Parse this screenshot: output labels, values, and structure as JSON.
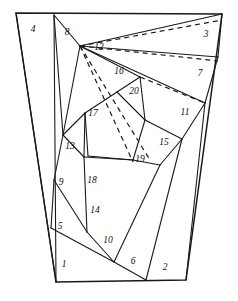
{
  "figure": {
    "type": "diagram",
    "canvas": {
      "width": 238,
      "height": 301
    },
    "background_color": "#ffffff",
    "line_color": "#1a1a1a",
    "outer_boundary_label": "quadrilateral outline",
    "region_count": 20,
    "labels": [
      {
        "id": "1",
        "text": "1",
        "x": 64,
        "y": 265
      },
      {
        "id": "2",
        "text": "2",
        "x": 165,
        "y": 268
      },
      {
        "id": "3",
        "text": "3",
        "x": 206,
        "y": 35
      },
      {
        "id": "4",
        "text": "4",
        "x": 33,
        "y": 30
      },
      {
        "id": "5",
        "text": "5",
        "x": 60,
        "y": 227
      },
      {
        "id": "6",
        "text": "6",
        "x": 133,
        "y": 262
      },
      {
        "id": "7",
        "text": "7",
        "x": 200,
        "y": 74
      },
      {
        "id": "8",
        "text": "8",
        "x": 67,
        "y": 33
      },
      {
        "id": "9",
        "text": "9",
        "x": 61,
        "y": 183
      },
      {
        "id": "10",
        "text": "10",
        "x": 108,
        "y": 241
      },
      {
        "id": "11",
        "text": "11",
        "x": 185,
        "y": 113
      },
      {
        "id": "12",
        "text": "12",
        "x": 99,
        "y": 48
      },
      {
        "id": "13",
        "text": "13",
        "x": 70,
        "y": 147
      },
      {
        "id": "14",
        "text": "14",
        "x": 95,
        "y": 211
      },
      {
        "id": "15",
        "text": "15",
        "x": 164,
        "y": 143
      },
      {
        "id": "16",
        "text": "16",
        "x": 119,
        "y": 72
      },
      {
        "id": "17",
        "text": "17",
        "x": 93,
        "y": 114
      },
      {
        "id": "18",
        "text": "18",
        "x": 92,
        "y": 181
      },
      {
        "id": "19",
        "text": "19",
        "x": 140,
        "y": 160
      },
      {
        "id": "20",
        "text": "20",
        "x": 134,
        "y": 92
      }
    ],
    "outer_boundary": "M 16,13 L 222,14 L 186,280 L 56,282 Z",
    "solid_edges": [
      "M 54,15 L 56,282",
      "M 54,15 L 63,135",
      "M 54,15 L 80,46",
      "M 80,46 L 222,14",
      "M 80,46 L 218,57",
      "M 80,46 L 205,103",
      "M 80,46 L 140,77",
      "M 80,46 L 63,135",
      "M 218,57 L 222,14",
      "M 218,57 L 205,103",
      "M 205,103 L 186,280",
      "M 205,103 L 182,139",
      "M 182,139 L 146,280",
      "M 182,139 L 160,165",
      "M 182,139 L 145,120",
      "M 160,165 L 114,262",
      "M 160,165 L 133,160",
      "M 140,77 L 117,92",
      "M 140,77 L 145,120",
      "M 145,120 L 133,160",
      "M 133,160 L 88,156",
      "M 88,156 L 85,113",
      "M 85,113 L 117,92",
      "M 117,92 L 145,120",
      "M 63,135 L 85,113",
      "M 63,135 L 84,157",
      "M 84,157 L 85,113",
      "M 84,157 L 133,160",
      "M 84,157 L 87,232",
      "M 63,135 L 54,180",
      "M 54,180 L 87,232",
      "M 54,180 L 51,228",
      "M 51,228 L 114,262",
      "M 87,232 L 114,262",
      "M 114,262 L 146,280",
      "M 16,13 L 56,282"
    ],
    "dashed_edges": [
      "M 80,46 L 222,20",
      "M 80,46 L 218,61",
      "M 80,46 L 150,160",
      "M 80,46 L 133,162",
      "M 140,77 L 205,103"
    ]
  }
}
